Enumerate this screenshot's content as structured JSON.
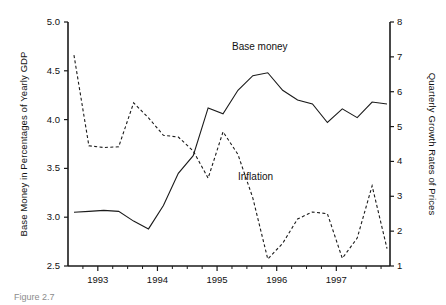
{
  "figure": {
    "caption": "Figure 2.7",
    "background_color": "#ffffff",
    "ink_color": "#1a1a1a"
  },
  "axes": {
    "left": {
      "title": "Base Money in Percentages of Yearly GDP",
      "ticks": [
        "2.5",
        "3.0",
        "3.5",
        "4.0",
        "4.5",
        "5.0"
      ],
      "min": 2.5,
      "max": 5.0
    },
    "right": {
      "title": "Quarterly Growth Rates of Prices",
      "ticks": [
        "1",
        "2",
        "3",
        "4",
        "5",
        "6",
        "7",
        "8"
      ],
      "min": 1,
      "max": 8
    },
    "bottom": {
      "ticks": [
        "1993",
        "1994",
        "1995",
        "1996",
        "1997"
      ],
      "min": 1992.5,
      "max": 1997.9
    }
  },
  "series_labels": {
    "base_money": "Base money",
    "inflation": "Inflation"
  },
  "chart_data": {
    "type": "line",
    "title": "",
    "xlabel": "",
    "ylabel": "Base Money in Percentages of Yearly GDP",
    "y2label": "Quarterly Growth Rates of Prices",
    "xlim": [
      1992.5,
      1997.9
    ],
    "ylim": [
      2.5,
      5.0
    ],
    "y2lim": [
      1,
      8
    ],
    "grid": false,
    "legend": "inline-annotations",
    "x": [
      1992.6,
      1992.85,
      1993.1,
      1993.35,
      1993.6,
      1993.85,
      1994.1,
      1994.35,
      1994.6,
      1994.85,
      1995.1,
      1995.35,
      1995.6,
      1995.85,
      1996.1,
      1996.35,
      1996.6,
      1996.85,
      1997.1,
      1997.35,
      1997.6,
      1997.85
    ],
    "series": [
      {
        "name": "Base money",
        "axis": "left",
        "style": "solid",
        "color": "#1a1a1a",
        "values": [
          3.05,
          3.06,
          3.07,
          3.06,
          2.96,
          2.88,
          3.12,
          3.45,
          3.63,
          4.12,
          4.06,
          4.3,
          4.45,
          4.48,
          4.3,
          4.2,
          4.16,
          3.97,
          4.11,
          4.02,
          4.18,
          4.16
        ]
      },
      {
        "name": "Inflation",
        "axis": "right",
        "style": "dashed",
        "color": "#1a1a1a",
        "values": [
          7.05,
          4.45,
          4.4,
          4.42,
          5.68,
          5.25,
          4.75,
          4.7,
          4.3,
          3.52,
          4.85,
          4.2,
          2.95,
          1.2,
          1.65,
          2.35,
          2.55,
          2.5,
          1.22,
          1.8,
          3.3,
          1.5
        ]
      }
    ],
    "annotations": [
      {
        "text": "Base money",
        "x": 1995.0,
        "y_left": 4.72
      },
      {
        "text": "Inflation",
        "x": 1995.1,
        "y_left": 3.4
      }
    ]
  }
}
